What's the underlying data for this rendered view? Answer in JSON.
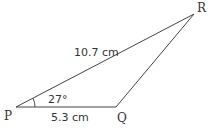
{
  "figure": {
    "type": "triangle",
    "vertices": {
      "P": "P",
      "Q": "Q",
      "R": "R"
    },
    "sides": {
      "PR": "10.7 cm",
      "PQ": "5.3 cm"
    },
    "angles": {
      "P": "27°"
    },
    "colors": {
      "stroke": "#333333",
      "text": "#333333"
    }
  }
}
